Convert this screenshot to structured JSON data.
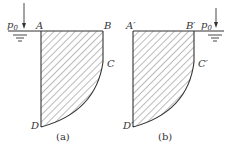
{
  "figure": {
    "panels": [
      {
        "caption": "(a)",
        "corners": {
          "top_left": "A",
          "top_right": "B",
          "curve_start": "C",
          "bottom": "D"
        },
        "pressure_label": "p",
        "pressure_subscript": "0",
        "pressure_side": "left"
      },
      {
        "caption": "(b)",
        "corners": {
          "top_left": "A′",
          "top_right": "B′",
          "curve_start": "C′",
          "bottom": "D′"
        },
        "pressure_label": "p",
        "pressure_subscript": "0",
        "pressure_side": "right"
      }
    ],
    "colors": {
      "stroke": "#333333",
      "hatch": "#555555",
      "background": "#ffffff"
    }
  }
}
